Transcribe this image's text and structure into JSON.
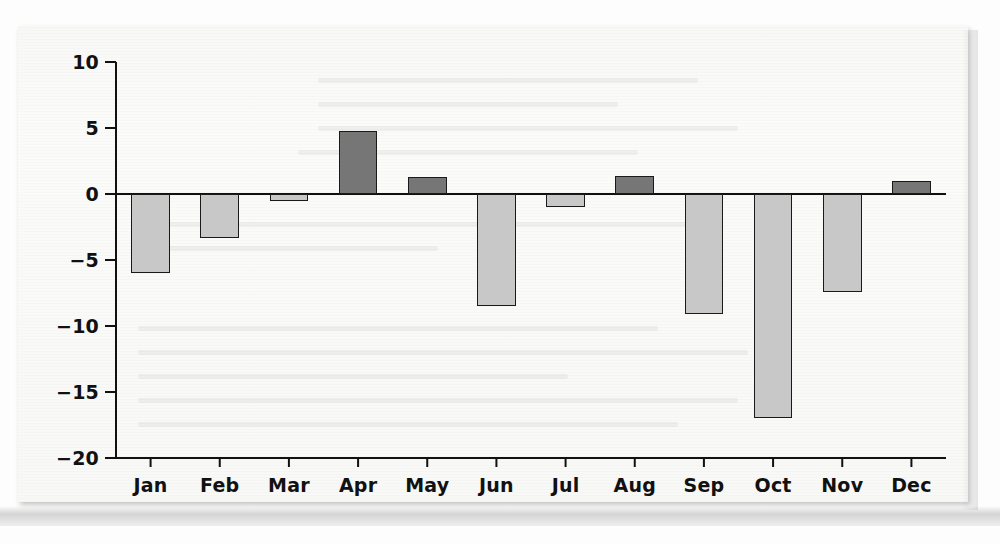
{
  "figure": {
    "background_color": "#fbfbfa",
    "axis_color": "#111111",
    "positive_bar_color": "#767676",
    "negative_bar_color": "#c8c8c8",
    "bar_edge_color": "#1a1a1a"
  },
  "chart_data": {
    "type": "bar",
    "title": "",
    "subtitle": "",
    "xlabel": "",
    "ylabel": "",
    "categories": [
      "Jan",
      "Feb",
      "Mar",
      "Apr",
      "May",
      "Jun",
      "Jul",
      "Aug",
      "Sep",
      "Oct",
      "Nov",
      "Dec"
    ],
    "values": [
      -6.0,
      -3.3,
      -0.5,
      4.8,
      1.3,
      -8.5,
      -1.0,
      1.4,
      -9.1,
      -17.0,
      -7.4,
      1.0
    ],
    "ylim": [
      -20,
      10
    ],
    "ytick_labels": [
      "10",
      "5",
      "0",
      "-5",
      "-10",
      "-15",
      "-20"
    ],
    "ytick_values": [
      10,
      5,
      0,
      -5,
      -10,
      -15,
      -20
    ],
    "grid": false,
    "legend": null,
    "zero_line": true,
    "annotations": []
  }
}
